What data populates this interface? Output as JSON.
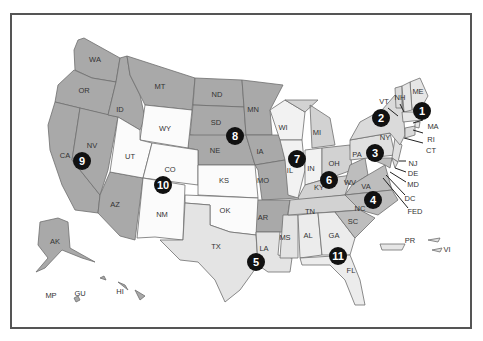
{
  "colors": {
    "dark": "#a9a9a9",
    "medium": "#c8c8c8",
    "light": "#e4e4e4",
    "white": "#fbfbfb",
    "marker": "#111111",
    "border": "#555555"
  },
  "circuits": [
    {
      "number": "1",
      "states": [
        "ME",
        "NH",
        "MA",
        "RI",
        "PR"
      ]
    },
    {
      "number": "2",
      "states": [
        "VT",
        "NY",
        "CT"
      ]
    },
    {
      "number": "3",
      "states": [
        "PA",
        "NJ",
        "DE",
        "VI"
      ]
    },
    {
      "number": "4",
      "states": [
        "MD",
        "VA",
        "WV",
        "NC",
        "SC"
      ]
    },
    {
      "number": "5",
      "states": [
        "TX",
        "LA",
        "MS"
      ]
    },
    {
      "number": "6",
      "states": [
        "MI",
        "OH",
        "KY",
        "TN"
      ]
    },
    {
      "number": "7",
      "states": [
        "WI",
        "IL",
        "IN"
      ]
    },
    {
      "number": "8",
      "states": [
        "ND",
        "SD",
        "NE",
        "MN",
        "IA",
        "MO",
        "AR"
      ]
    },
    {
      "number": "9",
      "states": [
        "WA",
        "OR",
        "CA",
        "NV",
        "ID",
        "MT",
        "AZ",
        "AK",
        "HI",
        "GU",
        "MP"
      ]
    },
    {
      "number": "10",
      "states": [
        "WY",
        "UT",
        "CO",
        "KS",
        "OK",
        "NM"
      ]
    },
    {
      "number": "11",
      "states": [
        "AL",
        "GA",
        "FL"
      ]
    }
  ],
  "labels": {
    "WA": "WA",
    "OR": "OR",
    "CA": "CA",
    "NV": "NV",
    "ID": "ID",
    "MT": "MT",
    "AZ": "AZ",
    "UT": "UT",
    "WY": "WY",
    "CO": "CO",
    "NM": "NM",
    "ND": "ND",
    "SD": "SD",
    "NE": "NE",
    "KS": "KS",
    "OK": "OK",
    "TX": "TX",
    "MN": "MN",
    "IA": "IA",
    "MO": "MO",
    "AR": "AR",
    "LA": "LA",
    "WI": "WI",
    "IL": "IL",
    "MI": "MI",
    "IN": "IN",
    "OH": "OH",
    "KY": "KY",
    "TN": "TN",
    "MS": "MS",
    "AL": "AL",
    "GA": "GA",
    "FL": "FL",
    "SC": "SC",
    "NC": "NC",
    "VA": "VA",
    "WV": "WV",
    "PA": "PA",
    "NY": "NY",
    "VT": "VT",
    "NH": "NH",
    "ME": "ME",
    "MA": "MA",
    "RI": "RI",
    "CT": "CT",
    "NJ": "NJ",
    "DE": "DE",
    "MD": "MD",
    "DC": "DC",
    "FED": "FED",
    "AK": "AK",
    "HI": "HI",
    "GU": "GU",
    "MP": "MP",
    "PR": "PR",
    "VI": "VI"
  },
  "markers": [
    "1",
    "2",
    "3",
    "4",
    "5",
    "6",
    "7",
    "8",
    "9",
    "10",
    "11"
  ]
}
